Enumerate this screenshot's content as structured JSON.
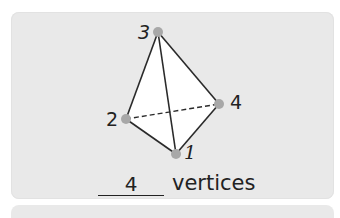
{
  "figure": {
    "shape": "triangular pyramid (tetrahedron)",
    "vertices": [
      {
        "label": "1",
        "x": 176,
        "y": 154
      },
      {
        "label": "2",
        "x": 126,
        "y": 119
      },
      {
        "label": "3",
        "x": 158,
        "y": 32
      },
      {
        "label": "4",
        "x": 219,
        "y": 104
      }
    ],
    "hidden_edge": [
      "2",
      "4"
    ],
    "dot_color": "#a8a8a8",
    "line_color": "#2a2a2a"
  },
  "answer": {
    "value": "4",
    "unit_label": "vertices"
  },
  "colors": {
    "card_bg": "#e9e9e9",
    "face_fill": "#ffffff"
  }
}
